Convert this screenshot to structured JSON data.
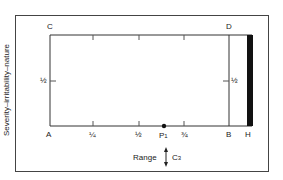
{
  "diagram": {
    "y_axis_label": "Severity–irritability–nature",
    "corners": {
      "top_left": "C",
      "top_right": "D",
      "bottom_left": "A",
      "bottom_right": "B",
      "bar_end": "H"
    },
    "x_ticks": [
      "¼",
      "½",
      "¾"
    ],
    "y_tick_left": "½",
    "y_tick_right": "½",
    "point": {
      "label": "P",
      "subscript": "1"
    },
    "range_label": "Range",
    "range_symbol": "↕",
    "range_target": {
      "label": "C",
      "subscript": "3"
    },
    "colors": {
      "line": "#333333",
      "bar": "#111111",
      "background": "#ffffff"
    }
  }
}
